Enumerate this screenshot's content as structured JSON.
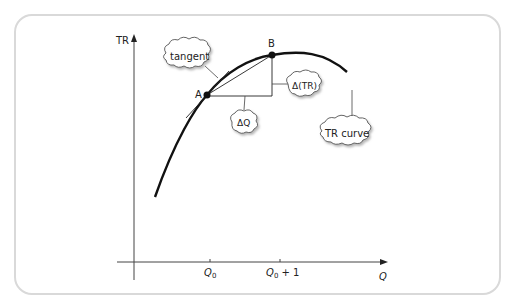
{
  "diagram": {
    "y_axis_label": "TR",
    "x_axis_label": "Q",
    "x_ticks": [
      {
        "label": "Q",
        "sub": "0",
        "suffix": ""
      },
      {
        "label": "Q",
        "sub": "0",
        "suffix": " + 1"
      }
    ],
    "points": [
      {
        "name": "A",
        "label": "A"
      },
      {
        "name": "B",
        "label": "B"
      }
    ],
    "callouts": {
      "tangent": "tangent",
      "delta_q": "ΔQ",
      "delta_tr": "Δ(TR)",
      "tr_curve": "TR curve"
    }
  },
  "colors": {
    "curve": "#111111",
    "axis": "#444444",
    "frame": "#d9d9d9",
    "cloud_stroke": "#555555",
    "cloud_shadow": "#bbbbbb"
  }
}
